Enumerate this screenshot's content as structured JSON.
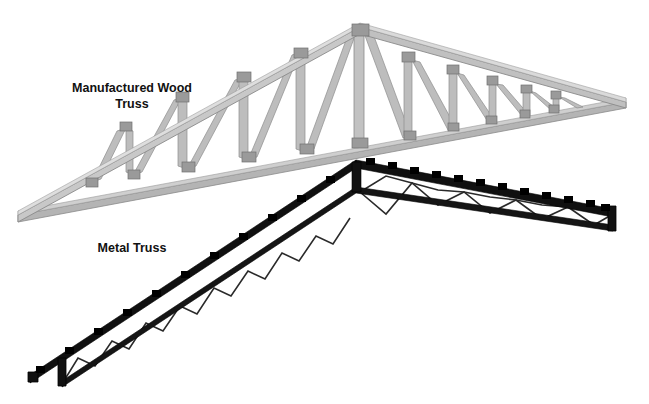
{
  "figure": {
    "background_color": "#ffffff",
    "width": 649,
    "height": 404
  },
  "labels": {
    "wood_truss": {
      "line1": "Manufactured Wood",
      "line2": "Truss",
      "color": "#111111",
      "x": 132,
      "y_line1": 92,
      "y_line2": 108
    },
    "metal_truss": {
      "line1": "Metal Truss",
      "color": "#111111",
      "x": 132,
      "y_line1": 252
    }
  },
  "wood_truss": {
    "name": "Manufactured Wood Truss",
    "member_color": "#b4b4b4",
    "member_edge_color": "#8a8a8a",
    "gusset_color": "#9a9a9a",
    "gusset_edge_color": "#6f6f6f",
    "apex": [
      360,
      27
    ],
    "left_heel": [
      18,
      215
    ],
    "right_tip": [
      626,
      102
    ],
    "top_chord_left": "M 18 215 L 360 27",
    "top_chord_right": "M 360 27 L 626 102",
    "bottom_chord": "M 18 215 L 626 102",
    "king_post": "M 360 27 L 360 144",
    "web_count": 16
  },
  "metal_truss": {
    "name": "Metal Truss",
    "member_color": "#1a1a1a",
    "chord_color": "#111111",
    "web_color": "#2a2a2a",
    "clip_color": "#000000",
    "peak": [
      356,
      163
    ],
    "left_end": [
      30,
      378
    ],
    "right_end": [
      613,
      212
    ],
    "top_chord_left": "M 30 378 L 356 163",
    "top_chord_right": "M 356 163 L 613 212",
    "bottom_chord_left": "M 62 384 L 356 190",
    "bottom_chord_right": "M 356 190 L 613 228",
    "clip_count_left": 11,
    "clip_count_right": 12
  }
}
